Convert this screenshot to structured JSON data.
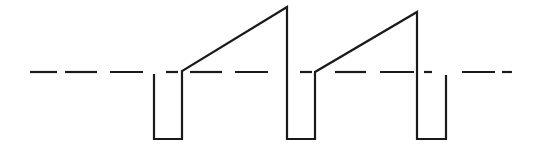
{
  "diagram": {
    "type": "waveform",
    "stroke_color": "#1a1a1a",
    "background": "#ffffff",
    "baseline": {
      "style": "dashed",
      "y": 72,
      "segments": [
        [
          30,
          57
        ],
        [
          65,
          97
        ],
        [
          110,
          143
        ],
        [
          166,
          178
        ],
        [
          190,
          222
        ],
        [
          235,
          268
        ],
        [
          300,
          312
        ],
        [
          335,
          366
        ],
        [
          380,
          414
        ],
        [
          424,
          432
        ],
        [
          462,
          495
        ],
        [
          502,
          512
        ]
      ]
    },
    "waveform_points": [
      [
        154,
        74
      ],
      [
        154,
        139
      ],
      [
        182,
        139
      ],
      [
        182,
        71
      ],
      [
        287,
        7
      ],
      [
        287,
        139
      ],
      [
        315,
        139
      ],
      [
        315,
        72
      ],
      [
        417,
        12
      ],
      [
        417,
        139
      ],
      [
        446,
        139
      ],
      [
        446,
        75
      ]
    ]
  }
}
